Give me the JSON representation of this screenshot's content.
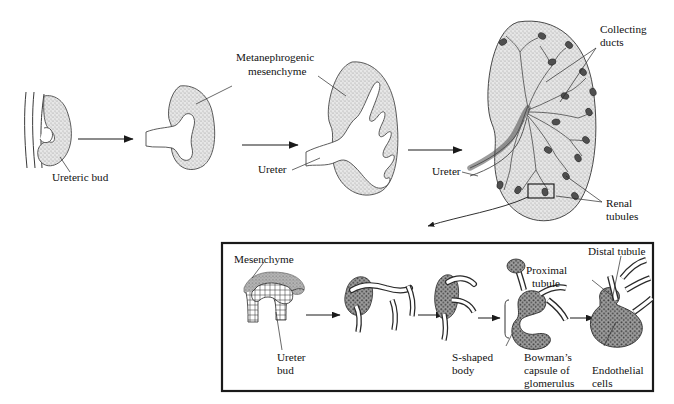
{
  "figure": {
    "background_color": "#ffffff",
    "ink_color": "#1a1a1a",
    "mesenchyme_fill": "#b9b9b9",
    "stipple_fill": "#d6d6d6"
  },
  "top_row": {
    "stages": [
      {
        "id": "stage-1",
        "caption": "Ureteric bud"
      },
      {
        "id": "stage-2",
        "caption": "Metanephrogenic mesenchyme"
      },
      {
        "id": "stage-3",
        "caption": "Ureter"
      },
      {
        "id": "stage-4",
        "caption": "Collecting ducts"
      }
    ],
    "labels": {
      "ureteric_bud": "Ureteric bud",
      "metanephrogenic_mesenchyme_l1": "Metanephrogenic",
      "metanephrogenic_mesenchyme_l2": "mesenchyme",
      "ureter_mid": "Ureter",
      "ureter_right": "Ureter",
      "collecting_ducts_l1": "Collecting",
      "collecting_ducts_l2": "ducts",
      "renal_tubules_l1": "Renal",
      "renal_tubules_l2": "tubules"
    }
  },
  "inset": {
    "labels": {
      "mesenchyme": "Mesenchyme",
      "ureter_bud_l1": "Ureter",
      "ureter_bud_l2": "bud",
      "s_shaped_body_l1": "S-shaped",
      "s_shaped_body_l2": "body",
      "bowmans_capsule_l1": "Bowman’s",
      "bowmans_capsule_l2": "capsule of",
      "bowmans_capsule_l3": "glomerulus",
      "endothelial_cells_l1": "Endothelial",
      "endothelial_cells_l2": "cells",
      "proximal_tubule_l1": "Proximal",
      "proximal_tubule_l2": "tubule",
      "distal_tubule": "Distal tubule"
    },
    "stages": [
      {
        "id": "inset-stage-1",
        "caption": "Ureter bud with mesenchyme cap"
      },
      {
        "id": "inset-stage-2",
        "caption": "Condensing mesenchyme"
      },
      {
        "id": "inset-stage-3",
        "caption": "Renal vesicle"
      },
      {
        "id": "inset-stage-4",
        "caption": "S-shaped body"
      },
      {
        "id": "inset-stage-5",
        "caption": "Maturing nephron"
      }
    ]
  }
}
